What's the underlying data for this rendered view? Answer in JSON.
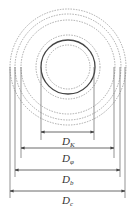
{
  "diagram": {
    "center": [
      68,
      67
    ],
    "circles": [
      {
        "r": 58,
        "style": "dashed"
      },
      {
        "r": 53,
        "style": "dashed"
      },
      {
        "r": 47,
        "style": "dashed"
      },
      {
        "r": 32,
        "style": "dashed"
      },
      {
        "r": 27,
        "style": "solid"
      },
      {
        "r": 22,
        "style": "dashed"
      }
    ],
    "dimensions": [
      {
        "label": "D",
        "sub": "K",
        "y": 132,
        "x1": 41,
        "x2": 94
      },
      {
        "label": "D",
        "sub": "φ",
        "y": 148,
        "x1": 21,
        "x2": 114
      },
      {
        "label": "D",
        "sub": "b",
        "y": 170,
        "x1": 15,
        "x2": 120
      },
      {
        "label": "D",
        "sub": "c",
        "y": 191,
        "x1": 10,
        "x2": 125
      }
    ]
  },
  "labels": {
    "dk": "D",
    "dk_sub": "K",
    "dp": "D",
    "dp_sub": "φ",
    "db": "D",
    "db_sub": "b",
    "dc": "D",
    "dc_sub": "c"
  }
}
